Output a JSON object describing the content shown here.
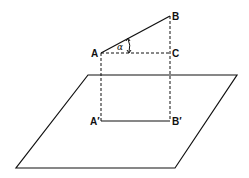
{
  "diagram": {
    "type": "geometry-projection",
    "colors": {
      "stroke": "#111111",
      "background": "#ffffff"
    },
    "points": {
      "A": {
        "label": "A",
        "x": 101,
        "y": 53
      },
      "B": {
        "label": "B",
        "x": 170,
        "y": 16
      },
      "C": {
        "label": "C",
        "x": 170,
        "y": 53
      },
      "A_prime": {
        "label": "A′",
        "x": 101,
        "y": 121
      },
      "B_prime": {
        "label": "B′",
        "x": 170,
        "y": 121
      }
    },
    "angle": {
      "label": "α",
      "vertex": "A"
    },
    "plane": {
      "corners": [
        [
          88,
          75
        ],
        [
          237,
          75
        ],
        [
          175,
          168
        ],
        [
          16,
          168
        ]
      ]
    },
    "segments": {
      "solid": [
        "AB",
        "A′B′"
      ],
      "dashed": [
        "AC",
        "AA′",
        "BB′"
      ]
    }
  }
}
